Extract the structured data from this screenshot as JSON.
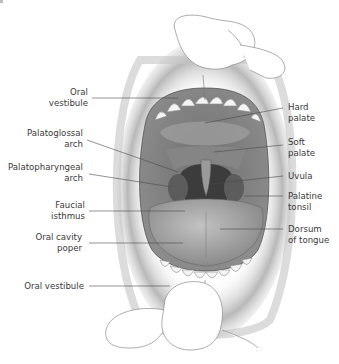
{
  "figure": {
    "labels_left": [
      {
        "id": "oral-vestibule-upper",
        "text": "Oral\nvestibule",
        "line1": "Oral",
        "line2": "vestibule"
      },
      {
        "id": "palatoglossal-arch",
        "line1": "Palatoglossal",
        "line2": "arch"
      },
      {
        "id": "palatopharyngeal-arch",
        "line1": "Palatopharyngeal",
        "line2": "arch"
      },
      {
        "id": "faucial-isthmus",
        "line1": "Faucial",
        "line2": "isthmus"
      },
      {
        "id": "oral-cavity-proper",
        "line1": "Oral cavity",
        "line2": "poper"
      },
      {
        "id": "oral-vestibule-lower",
        "line1": "Oral vestibule"
      }
    ],
    "labels_right": [
      {
        "id": "hard-palate",
        "line1": "Hard",
        "line2": "palate"
      },
      {
        "id": "soft-palate",
        "line1": "Soft",
        "line2": "palate"
      },
      {
        "id": "uvula",
        "line1": "Uvula"
      },
      {
        "id": "palatine-tonsil",
        "line1": "Palatine",
        "line2": "tonsil"
      },
      {
        "id": "dorsum-of-tongue",
        "line1": "Dorsum",
        "line2": "of tongue"
      }
    ],
    "colors": {
      "text": "#3a3a3a",
      "leader_line": "#4a4a4a",
      "lip_shade": "#9a9a9a",
      "palate": "#8c8c8c",
      "tongue": "#a8a8a8",
      "throat": "#3c3c3c",
      "teeth": "#f4f4f4"
    }
  }
}
